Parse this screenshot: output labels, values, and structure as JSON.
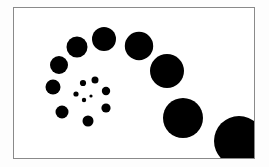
{
  "figure": {
    "frame": {
      "x": 13,
      "y": 7,
      "width": 242,
      "height": 152,
      "border_color": "#8a8a8a",
      "background": "#ffffff"
    },
    "dot_color": "#000000",
    "dots": [
      {
        "cx": 90,
        "cy": 95,
        "r": 1.6
      },
      {
        "cx": 83,
        "cy": 99,
        "r": 2.2
      },
      {
        "cx": 75,
        "cy": 93,
        "r": 2.6
      },
      {
        "cx": 82,
        "cy": 82,
        "r": 3.1
      },
      {
        "cx": 94,
        "cy": 79,
        "r": 3.5
      },
      {
        "cx": 105,
        "cy": 90,
        "r": 4.2
      },
      {
        "cx": 105,
        "cy": 107,
        "r": 4.6
      },
      {
        "cx": 87,
        "cy": 120,
        "r": 5.5
      },
      {
        "cx": 61,
        "cy": 111,
        "r": 6.5
      },
      {
        "cx": 52,
        "cy": 86,
        "r": 7.5
      },
      {
        "cx": 58,
        "cy": 64,
        "r": 9
      },
      {
        "cx": 76,
        "cy": 46,
        "r": 10.5
      },
      {
        "cx": 103,
        "cy": 38,
        "r": 12
      },
      {
        "cx": 138,
        "cy": 45,
        "r": 14.2
      },
      {
        "cx": 166,
        "cy": 70,
        "r": 17
      },
      {
        "cx": 182,
        "cy": 117,
        "r": 20
      },
      {
        "cx": 238,
        "cy": 140,
        "r": 25
      }
    ]
  }
}
